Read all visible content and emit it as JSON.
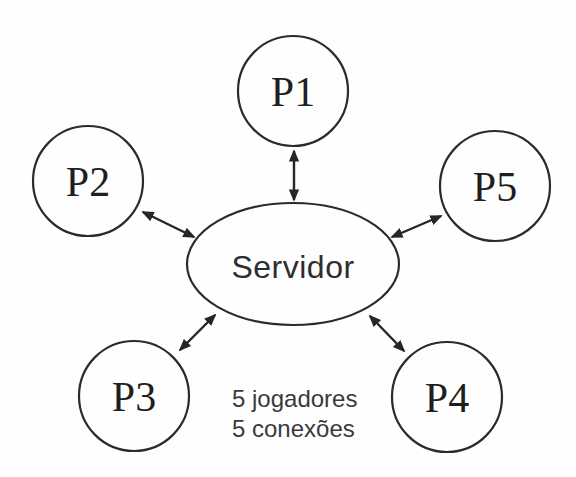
{
  "diagram": {
    "server": {
      "label": "Servidor"
    },
    "players": [
      {
        "label": "P1"
      },
      {
        "label": "P2"
      },
      {
        "label": "P3"
      },
      {
        "label": "P4"
      },
      {
        "label": "P5"
      }
    ],
    "annotation": {
      "line1": "5 jogadores",
      "line2": "5 conexões"
    },
    "colors": {
      "line": "#2b2b2b",
      "text": "#262626",
      "background": "#fefefe"
    }
  }
}
